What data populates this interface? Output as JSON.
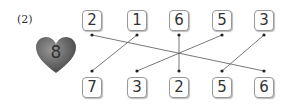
{
  "problem_label": "(2)",
  "heart": {
    "number": "8",
    "color": "#666666"
  },
  "top_row": [
    "2",
    "1",
    "6",
    "5",
    "3"
  ],
  "bottom_row": [
    "7",
    "3",
    "2",
    "5",
    "6"
  ],
  "connections": [
    {
      "top": "2",
      "bottom": "6"
    },
    {
      "top": "1",
      "bottom": "7"
    },
    {
      "top": "6",
      "bottom": "2"
    },
    {
      "top": "5",
      "bottom": "3"
    },
    {
      "top": "3",
      "bottom": "5"
    }
  ]
}
